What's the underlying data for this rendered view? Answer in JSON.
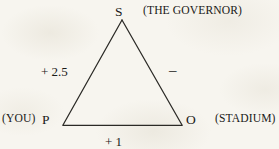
{
  "figure": {
    "background_color": "#f7f5ef",
    "line_color": "#2b2a26",
    "text_color": "#1a1a18"
  },
  "diagram": {
    "type": "signed-triangle-balance-graph",
    "vertices": [
      {
        "id": "S",
        "letter": "S",
        "annotation": "(THE GOVERNOR)",
        "x": 122,
        "y": 20
      },
      {
        "id": "P",
        "letter": "P",
        "annotation": "(YOU)",
        "x": 63,
        "y": 125
      },
      {
        "id": "O",
        "letter": "O",
        "annotation": "(STADIUM)",
        "x": 182,
        "y": 125
      }
    ],
    "edges": [
      {
        "id": "PS",
        "from": "P",
        "to": "S",
        "label": "+ 2.5"
      },
      {
        "id": "SO",
        "from": "S",
        "to": "O",
        "label": "–"
      },
      {
        "id": "PO",
        "from": "P",
        "to": "O",
        "label": "+ 1"
      }
    ]
  }
}
